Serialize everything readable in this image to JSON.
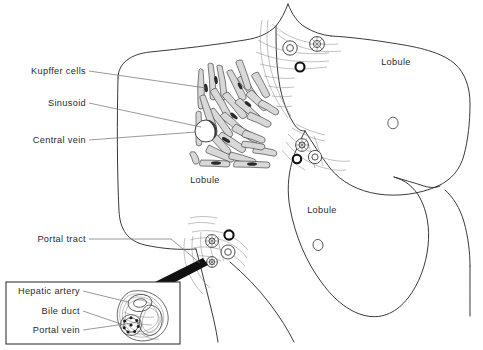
{
  "figure": {
    "type": "anatomical-diagram",
    "background_color": "#ffffff",
    "line_color": "#2f2f2f"
  },
  "labels": {
    "kupffer_cells": "Kupffer cells",
    "sinusoid": "Sinusoid",
    "central_vein": "Central vein",
    "portal_tract": "Portal tract",
    "lobule_left": "Lobule",
    "lobule_upper_right": "Lobule",
    "lobule_lower_right": "Lobule"
  },
  "inset": {
    "caption_hepatic_artery": "Hepatic artery",
    "caption_bile_duct": "Bile duct",
    "caption_portal_vein": "Portal vein"
  },
  "structures": {
    "central_vein_count": 3,
    "portal_triad_count": 3,
    "triad_components": [
      "hepatic artery",
      "bile duct",
      "portal vein"
    ]
  }
}
